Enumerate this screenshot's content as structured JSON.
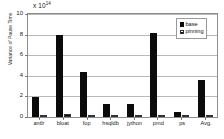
{
  "chart_data": {
    "type": "bar",
    "title": "",
    "xlabel": "",
    "ylabel": "Variance of Pause Time",
    "exponent_label": "x 10",
    "exponent_value": "14",
    "ylim": [
      0,
      10
    ],
    "yticks": [
      0,
      2,
      4,
      6,
      8,
      10
    ],
    "ytick_labels": [
      "0",
      "2",
      "4",
      "6",
      "8",
      "10"
    ],
    "grid": true,
    "legend_position": "top-right",
    "categories": [
      "antlr",
      "bloat",
      "fop",
      "hsqldb",
      "jython",
      "pmd",
      "ps",
      "Avg."
    ],
    "series": [
      {
        "name": "base",
        "color": "#0b0b0b",
        "values": [
          1.9,
          8.0,
          4.4,
          1.25,
          1.25,
          8.15,
          0.5,
          3.6
        ]
      },
      {
        "name": "pinning",
        "color": "#111111",
        "values": [
          0.05,
          0.25,
          0.04,
          0.05,
          0.06,
          0.05,
          0.04,
          0.07
        ]
      }
    ]
  },
  "legend": {
    "entries": [
      {
        "label": "base"
      },
      {
        "label": "pinning"
      }
    ]
  },
  "axis": {
    "y_title": "Variance of Pause Time",
    "y_labels": [
      "10",
      "8",
      "6",
      "4",
      "2",
      "0"
    ],
    "x_labels": [
      "antlr",
      "bloat",
      "fop",
      "hsqldb",
      "jython",
      "pmd",
      "ps",
      "Avg."
    ]
  },
  "exponent": {
    "mantissa": "x 10",
    "power": "14"
  }
}
